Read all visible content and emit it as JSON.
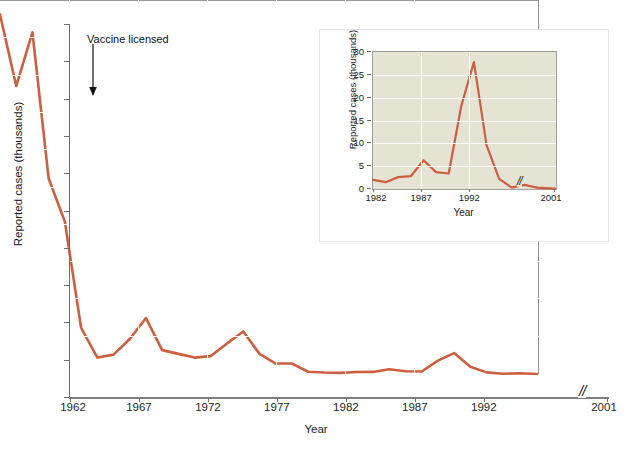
{
  "figure": {
    "annotation": "Vaccine licensed",
    "axis_break_symbol": "//",
    "line_color": "#cc5f3f",
    "main_background": "#c4d6cc",
    "inset_background": "#e4e3d4"
  },
  "main": {
    "xlabel": "Year",
    "ylabel": "Reported cases (thousands)",
    "ytick_labels": [
      "0",
      "50",
      "100",
      "150",
      "200",
      "250",
      "300",
      "350",
      "400",
      "450",
      "500"
    ],
    "xtick_labels": [
      "1962",
      "1967",
      "1972",
      "1977",
      "1982",
      "1987",
      "1992",
      "2001"
    ]
  },
  "inset": {
    "xlabel": "Year",
    "ylabel": "Reported cases (thousands)",
    "ytick_labels": [
      "0",
      "5",
      "10",
      "15",
      "20",
      "25",
      "30"
    ],
    "xtick_labels": [
      "1982",
      "1987",
      "1992",
      "2001"
    ]
  },
  "chart_data": [
    {
      "type": "line",
      "name": "main-series",
      "title": "",
      "xlabel": "Year",
      "ylabel": "Reported cases (thousands)",
      "xlim": [
        1962,
        2001
      ],
      "ylim": [
        0,
        500
      ],
      "ytick_values": [
        0,
        50,
        100,
        150,
        200,
        250,
        300,
        350,
        400,
        450,
        500
      ],
      "xtick_values": [
        1962,
        1967,
        1972,
        1977,
        1982,
        1987,
        1992,
        2001
      ],
      "grid": true,
      "legend": "none",
      "axis_break": {
        "after": 1994,
        "before": 2001,
        "symbol": "//"
      },
      "annotations": [
        {
          "text": "Vaccine licensed",
          "x": 1963,
          "y": 410
        }
      ],
      "x": [
        1962,
        1963,
        1964,
        1965,
        1966,
        1967,
        1968,
        1969,
        1970,
        1971,
        1972,
        1973,
        1974,
        1975,
        1976,
        1977,
        1978,
        1979,
        1980,
        1981,
        1982,
        1983,
        1984,
        1985,
        1986,
        1987,
        1988,
        1989,
        1990,
        1991,
        1992,
        1993,
        1994,
        2001
      ],
      "values": [
        482,
        386,
        458,
        262,
        204,
        62,
        22,
        26,
        47,
        75,
        32,
        27,
        22,
        24,
        41,
        57,
        27,
        14,
        14,
        3,
        2,
        1.5,
        2.6,
        2.8,
        6.3,
        3.7,
        3.4,
        18,
        28,
        9.6,
        2.2,
        0.3,
        1,
        0.1
      ]
    },
    {
      "type": "line",
      "name": "inset-series",
      "title": "",
      "xlabel": "Year",
      "ylabel": "Reported cases (thousands)",
      "xlim": [
        1982,
        2001
      ],
      "ylim": [
        0,
        30
      ],
      "ytick_values": [
        0,
        5,
        10,
        15,
        20,
        25,
        30
      ],
      "xtick_values": [
        1982,
        1987,
        1992,
        2001
      ],
      "grid": true,
      "legend": "none",
      "axis_break": {
        "after": 1995,
        "before": 2001,
        "symbol": "//"
      },
      "x": [
        1982,
        1983,
        1984,
        1985,
        1986,
        1987,
        1988,
        1989,
        1990,
        1991,
        1992,
        1993,
        1994,
        1995,
        2001
      ],
      "values": [
        2.0,
        1.5,
        2.6,
        2.8,
        6.3,
        3.7,
        3.4,
        18.2,
        27.8,
        9.6,
        2.2,
        0.3,
        0.9,
        0.3,
        0.1
      ]
    }
  ]
}
